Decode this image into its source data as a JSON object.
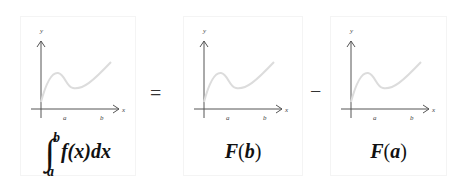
{
  "equation": {
    "operators": {
      "equals": "=",
      "minus": "−"
    },
    "panels": [
      {
        "id": "integral",
        "label_parts": {
          "integral_sign": "∫",
          "upper_limit": "b",
          "lower_limit": "a",
          "integrand": "f(x)dx"
        },
        "axes": {
          "x_label": "x",
          "y_label": "y",
          "tick_a": "a",
          "tick_b": "b"
        }
      },
      {
        "id": "F_of_b",
        "label_parts": {
          "func": "F",
          "open": "(",
          "arg": "b",
          "close": ")"
        },
        "axes": {
          "x_label": "x",
          "y_label": "y",
          "tick_a": "a",
          "tick_b": "b"
        }
      },
      {
        "id": "F_of_a",
        "label_parts": {
          "func": "F",
          "open": "(",
          "arg": "a",
          "close": ")"
        },
        "axes": {
          "x_label": "x",
          "y_label": "y",
          "tick_a": "a",
          "tick_b": "b"
        }
      }
    ],
    "colors": {
      "curve": "#dcdcdc",
      "axis": "#555555",
      "panel_border": "#f4f4f4"
    }
  }
}
